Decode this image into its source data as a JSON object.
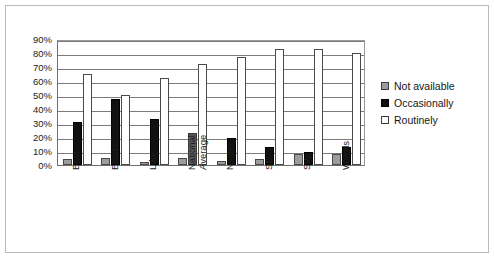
{
  "chart_data": {
    "type": "bar",
    "title": "",
    "subtitle": "",
    "xlabel": "",
    "ylabel": "",
    "ylim": [
      0,
      90
    ],
    "ytick_labels": [
      "90%",
      "80%",
      "70%",
      "60%",
      "50%",
      "40%",
      "30%",
      "20%",
      "10%",
      "0%"
    ],
    "ytick_values": [
      90,
      80,
      70,
      60,
      50,
      40,
      30,
      20,
      10,
      0
    ],
    "grid": true,
    "legend_position": "right",
    "categories": [
      "East",
      "Emids",
      "Ldn",
      "National Average",
      "NY&H",
      "SE",
      "SW",
      "Wmids"
    ],
    "series": [
      {
        "name": "Not available",
        "color": "#9c9c9c",
        "values": [
          4,
          5,
          2,
          5,
          3,
          4,
          8,
          8
        ]
      },
      {
        "name": "Occasionally",
        "color": "#111111",
        "values": [
          31,
          47,
          33,
          23,
          19,
          13,
          9,
          13
        ]
      },
      {
        "name": "Routinely",
        "color": "#ffffff",
        "values": [
          65,
          50,
          62,
          72,
          77,
          83,
          83,
          80
        ]
      }
    ]
  },
  "legend": {
    "items": [
      {
        "label": "Not available",
        "swatch": "notavail"
      },
      {
        "label": "Occasionally",
        "swatch": "occasionally"
      },
      {
        "label": "Routinely",
        "swatch": "routinely"
      }
    ]
  }
}
